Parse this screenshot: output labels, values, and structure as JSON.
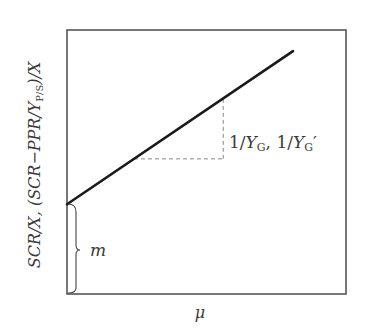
{
  "chart_data": {
    "type": "line",
    "title": "",
    "xlabel": "μ",
    "ylabel": "SCR/X, (SCR−PPR/Y_P/S)/X",
    "ylabel_parts": {
      "a": "SCR/X, (SCR−PPR/",
      "b": "Y",
      "b_sub": "P/S",
      "c": ")/X"
    },
    "ticks": "none",
    "grid": false,
    "series": [
      {
        "name": "maintenance-growth line",
        "x": [
          0,
          0.81
        ],
        "y": [
          0.34,
          0.92
        ]
      }
    ],
    "xlim": [
      0,
      1
    ],
    "ylim": [
      0,
      1
    ],
    "annotations": {
      "slope_label": {
        "prefix": "1/",
        "y1": "Y",
        "sub1": "G",
        "sep": ", 1/",
        "y2": "Y",
        "sub2": "G",
        "prime": "′"
      },
      "intercept_label": "m",
      "slope_triangle": {
        "x0": 0.24,
        "x1": 0.56
      }
    },
    "colors": {
      "line": "#1a1a1a",
      "frame": "#555555",
      "dash": "#888888",
      "text": "#3a3a3a"
    }
  }
}
